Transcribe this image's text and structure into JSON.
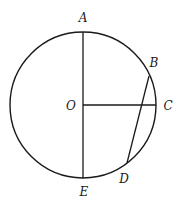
{
  "diagram": {
    "type": "geometry-circle",
    "stroke_color": "#1a1a1a",
    "circle": {
      "center": "O",
      "cx": 83,
      "cy": 105,
      "r": 73
    },
    "points": {
      "A": {
        "label": "A",
        "x": 83,
        "y": 32,
        "lx": 83,
        "ly": 22
      },
      "B": {
        "label": "B",
        "x": 149,
        "y": 76,
        "lx": 154,
        "ly": 67
      },
      "C": {
        "label": "C",
        "x": 156,
        "y": 105,
        "lx": 168,
        "ly": 110
      },
      "D": {
        "label": "D",
        "x": 127,
        "y": 163,
        "lx": 124,
        "ly": 183
      },
      "E": {
        "label": "E",
        "x": 83,
        "y": 178,
        "lx": 84,
        "ly": 196
      },
      "O": {
        "label": "O",
        "x": 83,
        "y": 105,
        "lx": 71,
        "ly": 110
      }
    },
    "segments": [
      {
        "name": "AE",
        "from": "A",
        "to": "E"
      },
      {
        "name": "OC",
        "from": "O",
        "to": "C"
      },
      {
        "name": "BD",
        "from": "B",
        "to": "D"
      }
    ]
  }
}
